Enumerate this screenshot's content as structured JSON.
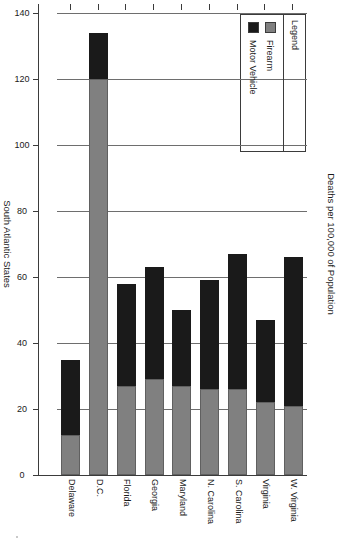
{
  "chart_data": {
    "type": "bar",
    "subtype": "stacked-horizontal",
    "title": "",
    "xlabel": "South Atlantic States",
    "ylabel": "Deaths per 100,000 of Population",
    "ylim": [
      0,
      140
    ],
    "ytick_step": 20,
    "grid": true,
    "legend_position": "top-left",
    "orientation": "rotated-90",
    "categories": [
      "W. Virginia",
      "Virginia",
      "S. Carolina",
      "N. Carolina",
      "Maryland",
      "Georgia",
      "Florida",
      "D.C.",
      "Delaware"
    ],
    "tick_labels": [
      "0",
      "20",
      "40",
      "60",
      "80",
      "100",
      "120",
      "140"
    ],
    "tick_values": [
      0,
      20,
      40,
      60,
      80,
      100,
      120,
      140
    ],
    "series": [
      {
        "name": "Firearm",
        "color": "#808080",
        "values": [
          21,
          22,
          26,
          26,
          27,
          29,
          27,
          120,
          12
        ]
      },
      {
        "name": "Motor Vehicle",
        "color": "#1a1a1a",
        "values": [
          45,
          25,
          41,
          33,
          23,
          34,
          31,
          14,
          23
        ]
      }
    ],
    "totals": [
      66,
      47,
      67,
      59,
      50,
      63,
      58,
      134,
      35
    ]
  },
  "legend": {
    "title": "Legend",
    "items": [
      {
        "label": "Firearm",
        "color": "#808080"
      },
      {
        "label": "Motor Vehicle",
        "color": "#1a1a1a"
      }
    ]
  },
  "axes": {
    "category_axis_title": "South Atlantic States",
    "value_axis_title": "Deaths per 100,000 of Population"
  },
  "colors": {
    "firearm": "#808080",
    "motor_vehicle": "#1a1a1a",
    "axis": "#3b3b3b",
    "grid": "#6e6e6e",
    "background": "#ffffff"
  }
}
